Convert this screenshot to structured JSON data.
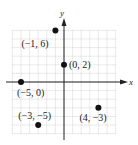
{
  "chart_data": {
    "type": "scatter",
    "title": "",
    "xlabel": "x",
    "ylabel": "y",
    "xlim": [
      -6,
      6
    ],
    "ylim": [
      -6,
      6
    ],
    "grid": true,
    "points": [
      {
        "x": -1,
        "y": 6,
        "label": "(−1, 6)"
      },
      {
        "x": 0,
        "y": 2,
        "label": "(0, 2)"
      },
      {
        "x": -5,
        "y": 0,
        "label": "(−5, 0)"
      },
      {
        "x": -3,
        "y": -5,
        "label": "(−3, −5)"
      },
      {
        "x": 4,
        "y": -3,
        "label": "(4, −3)"
      }
    ]
  },
  "axes": {
    "x_label": "x",
    "y_label": "y"
  },
  "colors": {
    "grid": "#b8b8b8",
    "axis": "#222222",
    "point": "#111111"
  }
}
